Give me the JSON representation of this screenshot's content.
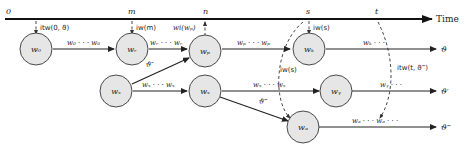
{
  "timeline": {
    "axis_label": "Time",
    "ticks": [
      {
        "id": "t0",
        "label": "0",
        "x": 8
      },
      {
        "id": "tm",
        "label": "m",
        "x": 131
      },
      {
        "id": "tn",
        "label": "n",
        "x": 205
      },
      {
        "id": "ts",
        "label": "s",
        "x": 308
      },
      {
        "id": "tt",
        "label": "t",
        "x": 377
      }
    ]
  },
  "nodes": {
    "w0": {
      "label": "w₀"
    },
    "wr": {
      "label": "wᵣ"
    },
    "wp": {
      "label": "wₚ"
    },
    "wk": {
      "label": "wₖ"
    },
    "wz1": {
      "label": "wₓ"
    },
    "wz2": {
      "label": "wₓ"
    },
    "wy": {
      "label": "wᵧ"
    },
    "wa": {
      "label": "wₐ"
    }
  },
  "edge_labels": {
    "w0_wr": "w₀ · · · w₀",
    "wr_wp": "wᵣ · · · wᵣ",
    "wp_wk": "wₚ · · · wₚ",
    "wk_end": "wₖ · · ·",
    "wz_wz": "wₓ · · · wₓ",
    "wz_wy": "wₓ · · · wₓ",
    "wy_end": "wᵧ · · ·",
    "wa_end": "wₐ · · · wₐ · · ·"
  },
  "branch_labels": {
    "theta2": "ϑ″",
    "theta3": "ϑ‴"
  },
  "annotations": {
    "itw0": "itw(0, ϑ)",
    "iwm": "iw(m)",
    "wiwp": "wi(wₚ)",
    "iws_top": "iw(s)",
    "iws_mid": "iw(s)",
    "itwt": "itw(t, ϑ‴)"
  },
  "outputs": {
    "theta": "ϑ",
    "theta1": "ϑ′",
    "theta3": "ϑ‴"
  },
  "colors": {
    "node_fill": "#e6e6e6",
    "node_stroke": "#4a4a4a",
    "line": "#222222"
  }
}
